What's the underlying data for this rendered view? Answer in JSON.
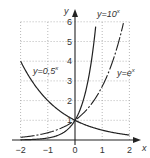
{
  "chart_data": {
    "type": "line",
    "title": "",
    "xlabel": "x",
    "ylabel": "y",
    "xlim": [
      -2,
      2
    ],
    "ylim": [
      0,
      6
    ],
    "grid": true,
    "x_ticks": [
      "−2",
      "−1",
      "0",
      "1",
      "2"
    ],
    "y_ticks": [
      "1",
      "2",
      "3",
      "4",
      "5",
      "6"
    ],
    "series": [
      {
        "name": "y=0,5^x",
        "label_base": "y=0,5",
        "label_exp": "x",
        "function": "0.5^x",
        "style": "solid",
        "x": [
          -2,
          -1,
          0,
          1,
          2
        ],
        "values": [
          4,
          2,
          1,
          0.5,
          0.25
        ]
      },
      {
        "name": "y=10^x",
        "label_base": "y=10",
        "label_exp": "x",
        "function": "10^x",
        "style": "solid",
        "x": [
          -2,
          -1,
          0,
          0.5,
          0.78
        ],
        "values": [
          0.01,
          0.1,
          1,
          3.16,
          6
        ]
      },
      {
        "name": "y=e^x",
        "label_base": "y=e",
        "label_exp": "x",
        "function": "e^x",
        "style": "dash-dot",
        "x": [
          -2,
          -1,
          0,
          1,
          1.79
        ],
        "values": [
          0.14,
          0.37,
          1,
          2.72,
          6
        ]
      }
    ]
  }
}
